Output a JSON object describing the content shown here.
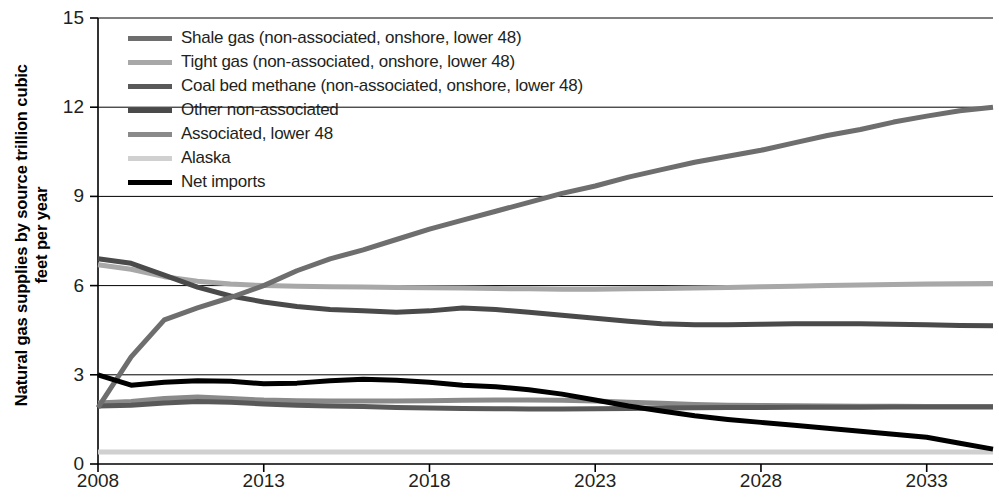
{
  "chart_data": {
    "type": "line",
    "title": "",
    "xlabel": "",
    "ylabel": "Natural gas supplies by source trillion cubic feet per year",
    "ylabel_line1": "Natural gas supplies by source trillion cubic",
    "ylabel_line2": "feet per year",
    "xlim": [
      2008,
      2035
    ],
    "ylim": [
      0,
      15
    ],
    "yticks": [
      0,
      3,
      6,
      9,
      12,
      15
    ],
    "xticks": [
      2008,
      2013,
      2018,
      2023,
      2028,
      2033
    ],
    "ytick_labels": [
      "0",
      "3",
      "6",
      "9",
      "12",
      "15"
    ],
    "xtick_labels": [
      "2008",
      "2013",
      "2018",
      "2023",
      "2028",
      "2033"
    ],
    "grid": "horizontal",
    "legend_position": "top-left",
    "x": [
      2008,
      2009,
      2010,
      2011,
      2012,
      2013,
      2014,
      2015,
      2016,
      2017,
      2018,
      2019,
      2020,
      2021,
      2022,
      2023,
      2024,
      2025,
      2026,
      2027,
      2028,
      2029,
      2030,
      2031,
      2032,
      2033,
      2034,
      2035
    ],
    "series": [
      {
        "name": "Shale gas (non-associated, onshore, lower 48)",
        "color": "#6e6e6e",
        "width": 5,
        "values": [
          1.9,
          3.6,
          4.85,
          5.25,
          5.6,
          6.0,
          6.5,
          6.9,
          7.2,
          7.55,
          7.9,
          8.2,
          8.5,
          8.8,
          9.1,
          9.35,
          9.65,
          9.9,
          10.15,
          10.35,
          10.55,
          10.8,
          11.05,
          11.25,
          11.5,
          11.7,
          11.88,
          12.0
        ]
      },
      {
        "name": "Tight gas (non-associated, onshore, lower 48)",
        "color": "#a8a8a8",
        "width": 5,
        "values": [
          6.7,
          6.55,
          6.3,
          6.15,
          6.05,
          6.0,
          5.98,
          5.96,
          5.95,
          5.94,
          5.93,
          5.92,
          5.9,
          5.89,
          5.88,
          5.88,
          5.89,
          5.9,
          5.92,
          5.94,
          5.96,
          5.98,
          6.0,
          6.02,
          6.04,
          6.05,
          6.06,
          6.07
        ]
      },
      {
        "name": "Coal bed methane (non-associated, onshore, lower 48)",
        "color": "#595959",
        "width": 5,
        "values": [
          1.95,
          1.98,
          2.05,
          2.1,
          2.08,
          2.02,
          1.98,
          1.95,
          1.93,
          1.9,
          1.88,
          1.87,
          1.86,
          1.85,
          1.85,
          1.86,
          1.87,
          1.88,
          1.89,
          1.9,
          1.9,
          1.91,
          1.91,
          1.91,
          1.92,
          1.92,
          1.92,
          1.92
        ]
      },
      {
        "name": "Other non-associated",
        "color": "#4a4a4a",
        "width": 5,
        "values": [
          6.9,
          6.75,
          6.35,
          5.95,
          5.65,
          5.45,
          5.3,
          5.2,
          5.15,
          5.1,
          5.15,
          5.25,
          5.2,
          5.1,
          5.0,
          4.9,
          4.8,
          4.72,
          4.68,
          4.68,
          4.7,
          4.72,
          4.72,
          4.72,
          4.7,
          4.68,
          4.66,
          4.65
        ]
      },
      {
        "name": "Associated, lower 48",
        "color": "#8a8a8a",
        "width": 5,
        "values": [
          2.05,
          2.1,
          2.2,
          2.25,
          2.2,
          2.15,
          2.13,
          2.12,
          2.12,
          2.12,
          2.13,
          2.14,
          2.15,
          2.15,
          2.14,
          2.12,
          2.08,
          2.04,
          2.0,
          1.98,
          1.97,
          1.96,
          1.95,
          1.94,
          1.94,
          1.93,
          1.93,
          1.93
        ]
      },
      {
        "name": "Alaska",
        "color": "#d0d0d0",
        "width": 5,
        "values": [
          0.4,
          0.4,
          0.4,
          0.4,
          0.4,
          0.4,
          0.4,
          0.4,
          0.4,
          0.4,
          0.4,
          0.4,
          0.4,
          0.4,
          0.4,
          0.4,
          0.4,
          0.4,
          0.4,
          0.4,
          0.4,
          0.4,
          0.4,
          0.4,
          0.4,
          0.4,
          0.4,
          0.4
        ]
      },
      {
        "name": "Net imports",
        "color": "#000000",
        "width": 5,
        "values": [
          3.0,
          2.65,
          2.75,
          2.8,
          2.78,
          2.7,
          2.72,
          2.8,
          2.85,
          2.82,
          2.75,
          2.65,
          2.6,
          2.5,
          2.35,
          2.15,
          1.95,
          1.78,
          1.62,
          1.5,
          1.4,
          1.3,
          1.2,
          1.1,
          1.0,
          0.9,
          0.7,
          0.5
        ]
      }
    ]
  }
}
